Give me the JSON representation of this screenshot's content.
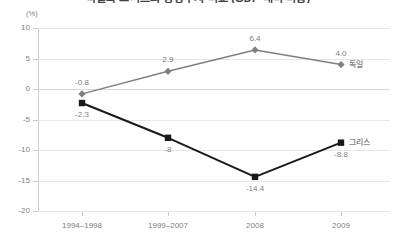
{
  "chart_data": {
    "type": "line",
    "title": "독일과 그리스의 경상수지 비교 (GDP 대비 비중)",
    "xlabel": "",
    "ylabel": "",
    "unit_label": "(%)",
    "categories": [
      "1994–1998",
      "1999–2007",
      "2008",
      "2009"
    ],
    "ylim": [
      -20,
      10
    ],
    "ytick_step": 5,
    "yticks": [
      "10",
      "5",
      "0",
      "-5",
      "-10",
      "-15",
      "-20"
    ],
    "grid": true,
    "legend_position": "end-of-line",
    "series": [
      {
        "name": "독일",
        "values": [
          -0.8,
          2.9,
          6.4,
          4.0
        ],
        "labels": [
          "-0.8",
          "2.9",
          "6.4",
          "4.0"
        ],
        "color": "#808080",
        "marker": "diamond"
      },
      {
        "name": "그리스",
        "values": [
          -2.3,
          -8,
          -14.4,
          -8.8
        ],
        "labels": [
          "-2.3",
          "-8",
          "-14.4",
          "-8.8"
        ],
        "color": "#1a1a1a",
        "marker": "square"
      }
    ]
  }
}
